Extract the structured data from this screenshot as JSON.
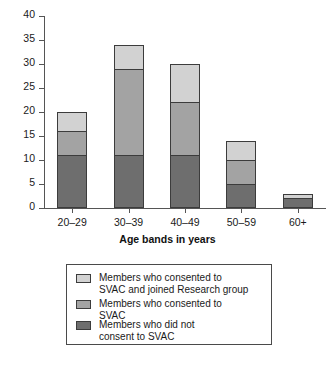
{
  "chart_data": {
    "type": "bar",
    "subtype": "stacked",
    "title": "",
    "xlabel": "Age bands in years",
    "ylabel": "",
    "categories": [
      "20–29",
      "30–39",
      "40–49",
      "50–59",
      "60+"
    ],
    "series": [
      {
        "name": "Members who did not\nconsent to SVAC",
        "color": "#6e6e6e",
        "values": [
          11,
          11,
          11,
          5,
          2
        ]
      },
      {
        "name": "Members who consented to\nSVAC",
        "color": "#a3a3a3",
        "values": [
          5,
          18,
          11,
          5,
          0
        ]
      },
      {
        "name": "Members who consented to\nSVAC and joined Research group",
        "color": "#d2d2d2",
        "values": [
          4,
          5,
          8,
          4,
          1
        ]
      }
    ],
    "totals": [
      20,
      34,
      30,
      14,
      3
    ],
    "ylim": [
      0,
      40
    ],
    "yticks": [
      0,
      5,
      10,
      15,
      20,
      25,
      30,
      35,
      40
    ],
    "grid": false,
    "legend_position": "bottom"
  },
  "axis": {
    "x_title": "Age bands in years",
    "y_ticks": [
      "0",
      "5",
      "10",
      "15",
      "20",
      "25",
      "30",
      "35",
      "40"
    ],
    "x_ticks": [
      "20–29",
      "30–39",
      "40–49",
      "50–59",
      "60+"
    ]
  },
  "legend": {
    "entries": [
      {
        "label": "Members who consented to\nSVAC and joined Research group",
        "color": "#d2d2d2"
      },
      {
        "label": "Members who consented to\nSVAC",
        "color": "#a3a3a3"
      },
      {
        "label": "Members who did not\nconsent to SVAC",
        "color": "#6e6e6e"
      }
    ]
  },
  "colors": {
    "light": "#d2d2d2",
    "medium": "#a3a3a3",
    "dark": "#6e6e6e",
    "outline": "#3c3c3c",
    "axis": "#555555",
    "background": "#ffffff"
  }
}
